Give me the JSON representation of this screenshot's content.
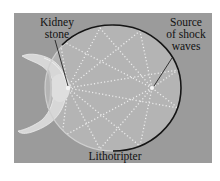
{
  "figure": {
    "background_color": "#9b9b9b",
    "ellipse_fill": "#b4b4b4",
    "ellipse_stroke": "#151515",
    "wave_color": "#e6e6e6"
  },
  "labels": {
    "kidney_stone_line1": "Kidney",
    "kidney_stone_line2": "stone",
    "source_line1": "Source",
    "source_line2": "of shock",
    "source_line3": "waves",
    "device": "Lithotripter"
  },
  "icons": {
    "patient": "human-figure-icon",
    "focus_point": "source-point-icon"
  }
}
